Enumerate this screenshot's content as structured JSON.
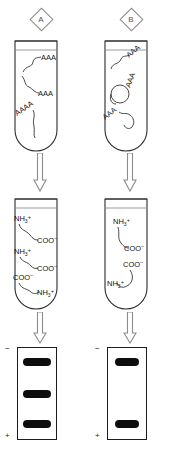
{
  "figure": {
    "background_color": "#ffffff",
    "ink_color": "#111111",
    "band_color": "#0d0d0d",
    "arrow_color": "#8c8c8c"
  },
  "panels": [
    {
      "id": "A",
      "label": "A",
      "top_tube": {
        "name": "mrna-tube-a",
        "molecules": [
          {
            "label": "AAA",
            "shape": "linear-squiggle",
            "rotation": 0
          },
          {
            "label": "AAA",
            "shape": "linear-squiggle",
            "rotation": 0
          },
          {
            "label": "AAAA",
            "shape": "linear-squiggle",
            "rotation": -35
          }
        ]
      },
      "arrows": [
        {
          "name": "arrow-translate-a",
          "direction": "down"
        },
        {
          "name": "arrow-electrophoresis-a",
          "direction": "down"
        }
      ],
      "middle_tube": {
        "name": "protein-tube-a",
        "peptides": [
          {
            "n_terminus": "NH3",
            "n_charge": "+",
            "c_terminus": "COO",
            "c_charge": "−"
          },
          {
            "n_terminus": "NH3",
            "n_charge": "+",
            "c_terminus": "COO",
            "c_charge": "−"
          },
          {
            "n_terminus": "NH3",
            "n_charge": "+",
            "c_terminus": "COO",
            "c_charge": "−"
          }
        ]
      },
      "gel": {
        "name": "gel-a",
        "negative_label": "−",
        "positive_label": "+",
        "band_count": 3,
        "bands": [
          {
            "index": 1,
            "position_pct": 16,
            "width": "wide"
          },
          {
            "index": 2,
            "position_pct": 50,
            "width": "wide"
          },
          {
            "index": 3,
            "position_pct": 82,
            "width": "wide"
          }
        ]
      }
    },
    {
      "id": "B",
      "label": "B",
      "top_tube": {
        "name": "mrna-tube-b",
        "molecules": [
          {
            "label": "AAA",
            "shape": "linear-squiggle",
            "rotation": -40
          },
          {
            "label": "AAA",
            "shape": "linear-squiggle",
            "rotation": -72
          },
          {
            "label": "AAA",
            "shape": "linear-squiggle",
            "rotation": -38
          },
          {
            "label": "",
            "shape": "circle-loop",
            "rotation": 0
          }
        ]
      },
      "arrows": [
        {
          "name": "arrow-translate-b",
          "direction": "down"
        },
        {
          "name": "arrow-electrophoresis-b",
          "direction": "down"
        }
      ],
      "middle_tube": {
        "name": "protein-tube-b",
        "peptides": [
          {
            "n_terminus": "NH3",
            "n_charge": "+",
            "c_terminus": "COO",
            "c_charge": "−"
          },
          {
            "n_terminus": "NH3",
            "n_charge": "+",
            "c_terminus": "COO",
            "c_charge": "−"
          }
        ]
      },
      "gel": {
        "name": "gel-b",
        "negative_label": "−",
        "positive_label": "+",
        "band_count": 2,
        "bands": [
          {
            "index": 1,
            "position_pct": 16,
            "width": "narrow"
          },
          {
            "index": 2,
            "position_pct": 82,
            "width": "narrow"
          }
        ]
      }
    }
  ],
  "text": {
    "poly_a_3": "AAA",
    "poly_a_4": "AAAA",
    "amino_label": "NH",
    "amino_sub": "3",
    "amino_sup": "+",
    "carboxyl_label": "COO",
    "carboxyl_sup": "−",
    "anode": "+",
    "cathode": "−"
  }
}
